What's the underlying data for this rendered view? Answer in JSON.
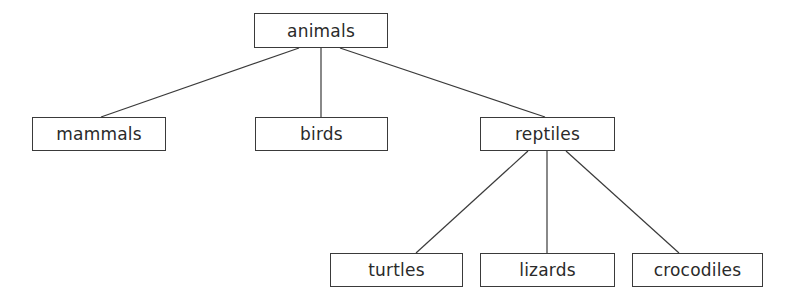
{
  "diagram": {
    "type": "tree",
    "line_color": "#3a3a3a",
    "nodes": [
      {
        "id": "animals",
        "label": "animals",
        "x": 254,
        "y": 13,
        "w": 134,
        "h": 35
      },
      {
        "id": "mammals",
        "label": "mammals",
        "x": 32,
        "y": 117,
        "w": 134,
        "h": 34
      },
      {
        "id": "birds",
        "label": "birds",
        "x": 255,
        "y": 117,
        "w": 133,
        "h": 34
      },
      {
        "id": "reptiles",
        "label": "reptiles",
        "x": 480,
        "y": 117,
        "w": 135,
        "h": 34
      },
      {
        "id": "turtles",
        "label": "turtles",
        "x": 330,
        "y": 253,
        "w": 133,
        "h": 34
      },
      {
        "id": "lizards",
        "label": "lizards",
        "x": 480,
        "y": 253,
        "w": 135,
        "h": 34
      },
      {
        "id": "crocodiles",
        "label": "crocodiles",
        "x": 632,
        "y": 253,
        "w": 131,
        "h": 34
      }
    ],
    "edges": [
      {
        "from": "animals",
        "to": "mammals",
        "x1": 299,
        "y1": 48,
        "x2": 101,
        "y2": 117
      },
      {
        "from": "animals",
        "to": "birds",
        "x1": 321,
        "y1": 48,
        "x2": 321,
        "y2": 117
      },
      {
        "from": "animals",
        "to": "reptiles",
        "x1": 340,
        "y1": 48,
        "x2": 545,
        "y2": 117
      },
      {
        "from": "reptiles",
        "to": "turtles",
        "x1": 528,
        "y1": 151,
        "x2": 416,
        "y2": 253
      },
      {
        "from": "reptiles",
        "to": "lizards",
        "x1": 547,
        "y1": 151,
        "x2": 547,
        "y2": 253
      },
      {
        "from": "reptiles",
        "to": "crocodiles",
        "x1": 566,
        "y1": 151,
        "x2": 679,
        "y2": 253
      }
    ]
  }
}
